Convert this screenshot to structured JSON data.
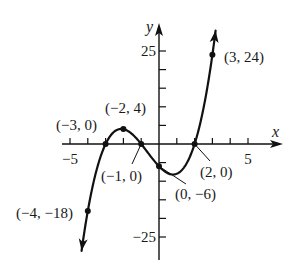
{
  "chart_data": {
    "type": "line",
    "title": "",
    "function": "f(x) = (x + 3)(x + 1)(x - 2) = x^3 + 2x^2 - 5x - 6",
    "xlabel": "x",
    "ylabel": "y",
    "xlim": [
      -5.8,
      6.8
    ],
    "ylim": [
      -30,
      29
    ],
    "x_ticks": [
      -5,
      -4,
      -3,
      -2,
      -1,
      1,
      2,
      3,
      4,
      5
    ],
    "x_tick_labels": [
      {
        "value": -5,
        "label": "−5"
      },
      {
        "value": 5,
        "label": "5"
      }
    ],
    "y_ticks": [
      -25,
      -20,
      -15,
      -10,
      -5,
      5,
      10,
      15,
      20,
      25
    ],
    "y_tick_labels": [
      {
        "value": 25,
        "label": "25"
      },
      {
        "value": -25,
        "label": "−25"
      }
    ],
    "grid": false,
    "legend": null,
    "series": [
      {
        "name": "f(x)",
        "x_range": [
          -4.35,
          3.18
        ],
        "arrows_at_ends": true
      }
    ],
    "points": [
      {
        "x": -4,
        "y": -18,
        "label": "(−4, −18)"
      },
      {
        "x": -3,
        "y": 0,
        "label": "(−3, 0)"
      },
      {
        "x": -2,
        "y": 4,
        "label": "(−2, 4)"
      },
      {
        "x": -1,
        "y": 0,
        "label": "(−1, 0)"
      },
      {
        "x": 0,
        "y": -6,
        "label": "(0, −6)"
      },
      {
        "x": 2,
        "y": 0,
        "label": "(2, 0)"
      },
      {
        "x": 3,
        "y": 24,
        "label": "(3, 24)"
      }
    ]
  }
}
